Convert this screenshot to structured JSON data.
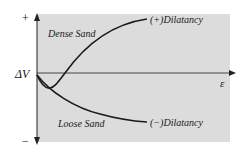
{
  "diagram": {
    "type": "line_sketch",
    "y_axis": {
      "label": "ΔV",
      "positive_label": "+",
      "negative_label": "−"
    },
    "x_axis": {
      "label": "ε"
    },
    "curves": [
      {
        "name": "dense-sand",
        "region_label": "Dense Sand",
        "end_label": "(+)Dilatancy"
      },
      {
        "name": "loose-sand",
        "region_label": "Loose Sand",
        "end_label": "(−)Dilatancy"
      }
    ],
    "colors": {
      "panel": "#dcdcdc",
      "line": "#1a1a1a",
      "axis": "#444444"
    }
  }
}
